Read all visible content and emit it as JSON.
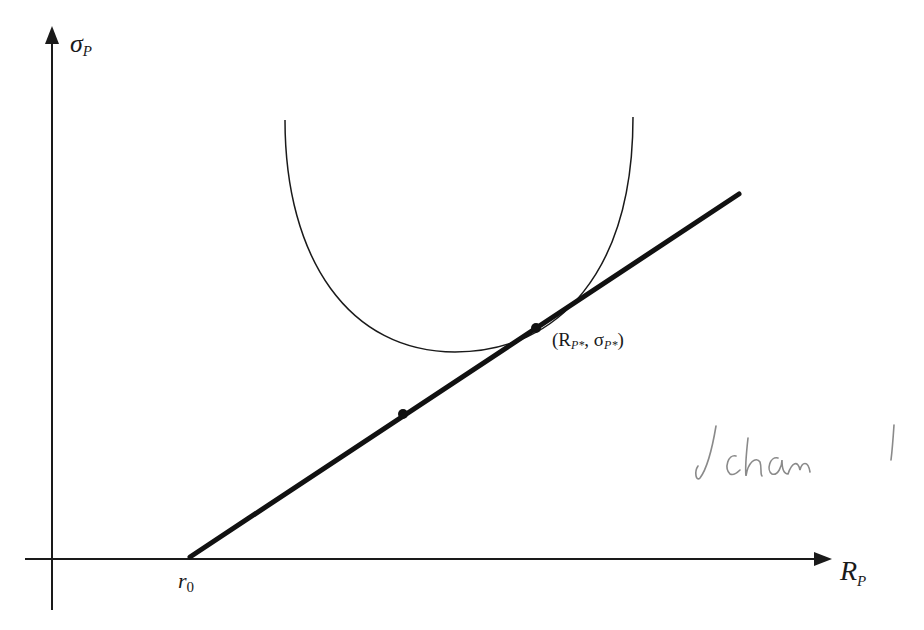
{
  "diagram": {
    "y_axis": {
      "label": "σ",
      "subscript": "P"
    },
    "x_axis": {
      "label": "R",
      "subscript": "P"
    },
    "origin_label": {
      "label": "r",
      "subscript": "0"
    },
    "tangent_point_label": {
      "open": "(R",
      "sub1": "P*",
      "mid": ", σ",
      "sub2": "P*",
      "close": ")"
    },
    "annotation": "Schön !",
    "colors": {
      "ink": "#1a1a1a",
      "pencil": "#8a8a8a",
      "background": "#ffffff"
    }
  }
}
